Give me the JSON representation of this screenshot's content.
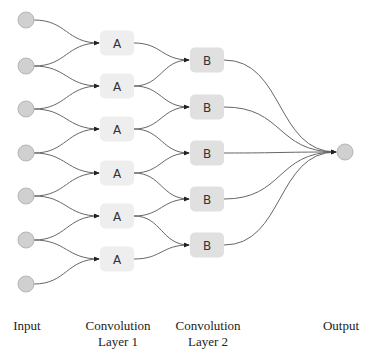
{
  "diagram": {
    "layers": [
      {
        "id": "input",
        "label": "Input",
        "kind": "circle",
        "count": 7
      },
      {
        "id": "conv1",
        "label": "Convolution\nLayer 1",
        "label_line1": "Convolution",
        "label_line2": "Layer 1",
        "kind": "box",
        "node_text": "A",
        "count": 6
      },
      {
        "id": "conv2",
        "label": "Convolution\nLayer 2",
        "label_line1": "Convolution",
        "label_line2": "Layer 2",
        "kind": "box",
        "node_text": "B",
        "count": 5
      },
      {
        "id": "output",
        "label": "Output",
        "kind": "circle",
        "count": 1
      }
    ],
    "connections": [
      {
        "from": "input",
        "to": "conv1",
        "pattern": "window-2"
      },
      {
        "from": "conv1",
        "to": "conv2",
        "pattern": "window-2"
      },
      {
        "from": "conv2",
        "to": "output",
        "pattern": "all-to-one"
      }
    ],
    "colors": {
      "circle_fill": "#d0d0d0",
      "circle_stroke": "#b5b5b5",
      "box_a_fill": "#eeeeee",
      "box_b_fill": "#e0e0e0",
      "edge": "#666666",
      "arrow": "#222222"
    }
  },
  "labels": {
    "input": "Input",
    "conv1_line1": "Convolution",
    "conv1_line2": "Layer 1",
    "conv2_line1": "Convolution",
    "conv2_line2": "Layer 2",
    "output": "Output"
  }
}
